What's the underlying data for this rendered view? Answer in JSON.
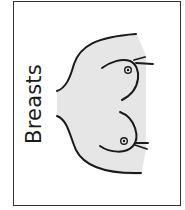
{
  "card": {
    "label": "Breasts",
    "border_color": "#333333",
    "fill_color": "#e6e6e6",
    "line_color": "#1a1a1a"
  },
  "illustration": {
    "subject": "breasts-outline",
    "orientation": "rotated-90-degrees"
  }
}
